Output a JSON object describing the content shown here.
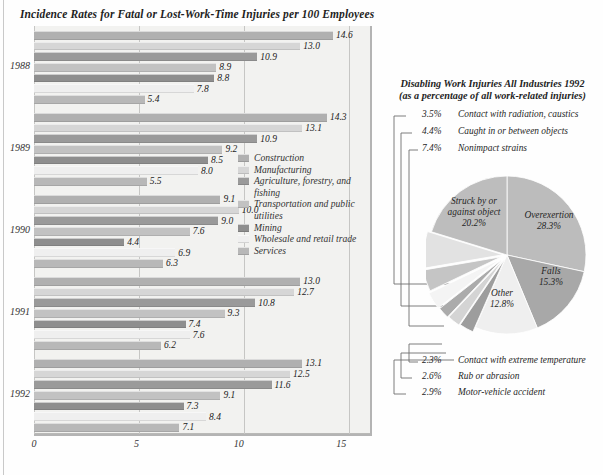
{
  "bar_chart": {
    "title": "Incidence Rates for Fatal or Lost-Work-Time Injuries per 100 Employees",
    "axis_ticks": [
      "0",
      "5",
      "10",
      "15"
    ],
    "years": [
      "1988",
      "1989",
      "1990",
      "1991",
      "1992"
    ],
    "legend": [
      {
        "label": "Construction",
        "color": "#b0b0b0"
      },
      {
        "label": "Manufacturing",
        "color": "#d6d6d6"
      },
      {
        "label": "Agriculture, forestry, and fishing",
        "color": "#9a9a9a"
      },
      {
        "label": "Transportation and public utilities",
        "color": "#c2c2c2"
      },
      {
        "label": "Mining",
        "color": "#8e8e8e"
      },
      {
        "label": "Wholesale and retail trade",
        "color": "#efefef"
      },
      {
        "label": "Services",
        "color": "#b8b8b8"
      }
    ]
  },
  "chart_data": [
    {
      "type": "bar",
      "title": "Incidence Rates for Fatal or Lost-Work-Time Injuries per 100 Employees",
      "orientation": "horizontal",
      "xlabel": "",
      "ylabel": "",
      "xlim": [
        0,
        16.5
      ],
      "grid": true,
      "xticks": [
        0,
        5,
        10,
        15
      ],
      "categories": [
        "1988",
        "1989",
        "1990",
        "1991",
        "1992"
      ],
      "series": [
        {
          "name": "Construction",
          "color": "#b0b0b0",
          "values": [
            14.6,
            14.3,
            9.1,
            13.0,
            13.1
          ]
        },
        {
          "name": "Manufacturing",
          "color": "#d6d6d6",
          "values": [
            13.0,
            13.1,
            10.0,
            12.7,
            12.5
          ]
        },
        {
          "name": "Agriculture, forestry, and fishing",
          "color": "#9a9a9a",
          "values": [
            10.9,
            10.9,
            9.0,
            10.8,
            11.6
          ]
        },
        {
          "name": "Transportation and public utilities",
          "color": "#c2c2c2",
          "values": [
            8.9,
            9.2,
            7.6,
            9.3,
            9.1
          ]
        },
        {
          "name": "Mining",
          "color": "#8e8e8e",
          "values": [
            8.8,
            8.5,
            4.4,
            7.4,
            7.3
          ]
        },
        {
          "name": "Wholesale and retail trade",
          "color": "#efefef",
          "values": [
            7.8,
            8.0,
            6.9,
            7.6,
            8.4
          ]
        },
        {
          "name": "Services",
          "color": "#b8b8b8",
          "values": [
            5.4,
            5.5,
            6.3,
            6.2,
            7.1
          ]
        }
      ],
      "bar_labels": {
        "1988": [
          "14.6",
          "13.0",
          "10.9",
          "8.9",
          "8.8",
          "7.8",
          "5.4"
        ],
        "1989": [
          "14.3",
          "13.1",
          "10.9",
          "9.2",
          "8.5",
          "8.0",
          "5.5"
        ],
        "1990": [
          "9.1",
          "10.0",
          "9.0",
          "7.6",
          "4.4",
          "6.9",
          "6.3"
        ],
        "1991": [
          "13.0",
          "12.7",
          "10.8",
          "9.3",
          "7.4",
          "7.6",
          "6.2"
        ],
        "1992": [
          "13.1",
          "12.5",
          "11.6",
          "9.1",
          "7.3",
          "8.4",
          "7.1"
        ]
      }
    },
    {
      "type": "pie",
      "title": "Disabling Work Injuries All Industries 1992",
      "subtitle": "(as a percentage of all work-related injuries)",
      "labels": [
        "Overexertion",
        "Falls",
        "Other",
        "Motor-vehicle accident",
        "Rub or abrasion",
        "Contact with extreme temperature",
        "Contact with radiation, caustics",
        "Caught in or between objects",
        "Nonimpact strains",
        "Struck by or against object"
      ],
      "values": [
        28.3,
        15.3,
        12.8,
        2.9,
        2.6,
        2.3,
        3.5,
        4.4,
        7.4,
        20.2
      ],
      "value_labels": [
        "28.3%",
        "15.3%",
        "12.8%",
        "2.9%",
        "2.6%",
        "2.3%",
        "3.5%",
        "4.4%",
        "7.4%",
        "20.2%"
      ],
      "colors": [
        "#bcbcbc",
        "#a8a8a8",
        "#efefef",
        "#9d9d9d",
        "#d4d4d4",
        "#ababab",
        "#f4f4f4",
        "#c5c5c5",
        "#e2e2e2",
        "#bdbdbd"
      ],
      "legend_position": "callouts"
    }
  ],
  "pie_chart": {
    "title": "Disabling Work Injuries All Industries 1992",
    "subtitle": "(as a percentage of all work-related injuries)",
    "inside_labels": [
      {
        "name": "Struck by or against object",
        "pct": "20.2%",
        "line1": "Struck by or",
        "line2": "against object"
      },
      {
        "name": "Overexertion",
        "pct": "28.3%",
        "line1": "Overexertion",
        "line2": ""
      },
      {
        "name": "Falls",
        "pct": "15.3%",
        "line1": "Falls",
        "line2": ""
      },
      {
        "name": "Other",
        "pct": "12.8%",
        "line1": "Other",
        "line2": ""
      }
    ],
    "callouts_top": [
      {
        "pct": "3.5%",
        "label": "Contact with radiation, caustics"
      },
      {
        "pct": "4.4%",
        "label": "Caught in or between objects"
      },
      {
        "pct": "7.4%",
        "label": "Nonimpact strains"
      }
    ],
    "callouts_bottom": [
      {
        "pct": "2.3%",
        "label": "Contact with extreme temperature"
      },
      {
        "pct": "2.6%",
        "label": "Rub or abrasion"
      },
      {
        "pct": "2.9%",
        "label": "Motor-vehicle accident"
      }
    ]
  }
}
